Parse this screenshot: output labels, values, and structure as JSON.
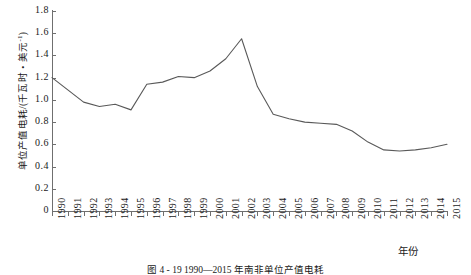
{
  "chart_data": {
    "type": "line",
    "title": "",
    "caption": "图 4 - 19   1990—2015 年南非单位产值电耗",
    "xlabel": "年份",
    "ylabel": "单位产值电耗/(千瓦时・美元",
    "ylabel_sup": "-1",
    "ylabel_tail": ")",
    "xlim": [
      1990,
      2015
    ],
    "ylim": [
      0,
      1.8
    ],
    "grid": false,
    "legend": null,
    "line_color": "#595959",
    "axis_color": "#6f6f6f",
    "ytick_labels": [
      "1.8",
      "1.6",
      "1.4",
      "1.2",
      "1.0",
      "0.8",
      "0.6",
      "0.4",
      "0.2",
      "0"
    ],
    "ytick_values": [
      1.8,
      1.6,
      1.4,
      1.2,
      1.0,
      0.8,
      0.6,
      0.4,
      0.2,
      0
    ],
    "categories": [
      "1990",
      "1991",
      "1992",
      "1993",
      "1994",
      "1995",
      "1996",
      "1997",
      "1998",
      "1999",
      "2000",
      "2001",
      "2002",
      "2003",
      "2004",
      "2005",
      "2006",
      "2007",
      "2008",
      "2009",
      "2010",
      "2011",
      "2012",
      "2013",
      "2014",
      "2015"
    ],
    "values": [
      1.2,
      1.09,
      0.98,
      0.94,
      0.96,
      0.91,
      1.14,
      1.16,
      1.21,
      1.2,
      1.26,
      1.37,
      1.55,
      1.12,
      0.87,
      0.83,
      0.8,
      0.79,
      0.78,
      0.72,
      0.62,
      0.55,
      0.54,
      0.55,
      0.57,
      0.6
    ],
    "series_name": "南非单位产值电耗"
  }
}
